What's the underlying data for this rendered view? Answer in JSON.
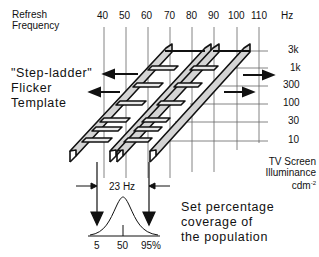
{
  "title_left": {
    "line1": "Refresh",
    "line2": "Frequency"
  },
  "x_axis": {
    "ticks": [
      "40",
      "50",
      "60",
      "70",
      "80",
      "90",
      "100",
      "110"
    ],
    "unit": "Hz"
  },
  "y_axis": {
    "ticks": [
      "3k",
      "1k",
      "300",
      "100",
      "30",
      "10"
    ],
    "label_line1": "TV Screen",
    "label_line2": "Illuminance",
    "label_line3": "cdm",
    "label_sup": "-2"
  },
  "template_label": {
    "line1": "\"Step-ladder\"",
    "line2": "Flicker",
    "line3": "Template"
  },
  "bandwidth_label": "23 Hz",
  "distribution": {
    "ticks": [
      "5",
      "50",
      "95%"
    ]
  },
  "caption": {
    "line1": "Set percentage",
    "line2": "coverage of",
    "line3": "the population"
  },
  "colors": {
    "line": "#111111",
    "grid": "#555555",
    "fill": "#d4d4d4"
  }
}
